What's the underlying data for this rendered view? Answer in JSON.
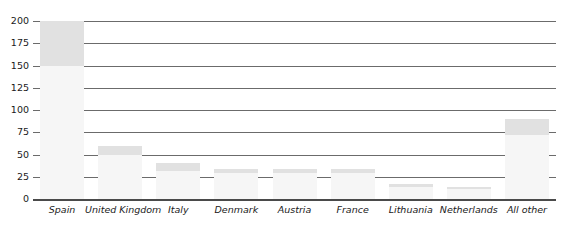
{
  "chart_data": {
    "type": "bar",
    "title": "",
    "subtitle": "",
    "xlabel": "",
    "ylabel": "",
    "ylim": [
      0,
      200
    ],
    "yticks": [
      0,
      25,
      50,
      75,
      100,
      125,
      150,
      175,
      200
    ],
    "ytick_labels": [
      "0",
      "25",
      "50",
      "75",
      "100",
      "125",
      "150",
      "175",
      "200"
    ],
    "grid": true,
    "legend": false,
    "legend_position": "none",
    "categories": [
      "Spain",
      "United Kingdom",
      "Italy",
      "Denmark",
      "Austria",
      "France",
      "Lithuania",
      "Netherlands",
      "All other"
    ],
    "values": [
      200,
      60,
      40,
      34,
      34,
      34,
      17,
      14,
      90
    ],
    "shaded_top_from": [
      150,
      50,
      32,
      29,
      29,
      29,
      14,
      11,
      72
    ],
    "colors": {
      "bar_fill_light": "#f6f6f6",
      "bar_fill_dark": "#e1e1e1",
      "gridline": "#6b6b6b",
      "baseline": "#4a4a4a",
      "text": "#1a1a1a",
      "background": "#ffffff"
    }
  }
}
